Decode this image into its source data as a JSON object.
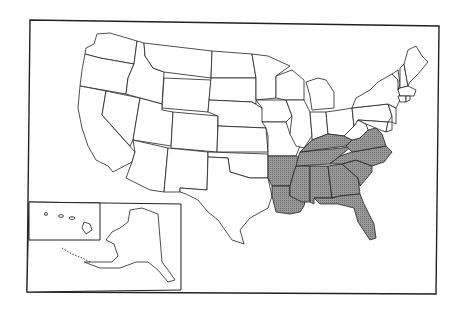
{
  "map": {
    "title": "United States",
    "width": 462,
    "height": 314,
    "colors": {
      "background": "#ffffff",
      "shaded_fill": "#8c8c8c",
      "unshaded_fill": "#ffffff",
      "border": "#222222"
    },
    "legend": null,
    "shaded_states": [
      "Arkansas",
      "Louisiana",
      "Mississippi",
      "Alabama",
      "Tennessee",
      "Kentucky",
      "Georgia",
      "Florida",
      "South Carolina",
      "North Carolina",
      "Virginia"
    ],
    "insets": [
      "Hawaii",
      "Alaska"
    ],
    "states": [
      {
        "name": "Washington",
        "shaded": false
      },
      {
        "name": "Oregon",
        "shaded": false
      },
      {
        "name": "California",
        "shaded": false
      },
      {
        "name": "Idaho",
        "shaded": false
      },
      {
        "name": "Nevada",
        "shaded": false
      },
      {
        "name": "Montana",
        "shaded": false
      },
      {
        "name": "Wyoming",
        "shaded": false
      },
      {
        "name": "Utah",
        "shaded": false
      },
      {
        "name": "Arizona",
        "shaded": false
      },
      {
        "name": "Colorado",
        "shaded": false
      },
      {
        "name": "New Mexico",
        "shaded": false
      },
      {
        "name": "North Dakota",
        "shaded": false
      },
      {
        "name": "South Dakota",
        "shaded": false
      },
      {
        "name": "Nebraska",
        "shaded": false
      },
      {
        "name": "Kansas",
        "shaded": false
      },
      {
        "name": "Oklahoma",
        "shaded": false
      },
      {
        "name": "Texas",
        "shaded": false
      },
      {
        "name": "Minnesota",
        "shaded": false
      },
      {
        "name": "Iowa",
        "shaded": false
      },
      {
        "name": "Missouri",
        "shaded": false
      },
      {
        "name": "Arkansas",
        "shaded": true
      },
      {
        "name": "Louisiana",
        "shaded": true
      },
      {
        "name": "Wisconsin",
        "shaded": false
      },
      {
        "name": "Illinois",
        "shaded": false
      },
      {
        "name": "Michigan",
        "shaded": false
      },
      {
        "name": "Indiana",
        "shaded": false
      },
      {
        "name": "Ohio",
        "shaded": false
      },
      {
        "name": "Kentucky",
        "shaded": true
      },
      {
        "name": "Tennessee",
        "shaded": true
      },
      {
        "name": "Mississippi",
        "shaded": true
      },
      {
        "name": "Alabama",
        "shaded": true
      },
      {
        "name": "Georgia",
        "shaded": true
      },
      {
        "name": "Florida",
        "shaded": true
      },
      {
        "name": "South Carolina",
        "shaded": true
      },
      {
        "name": "North Carolina",
        "shaded": true
      },
      {
        "name": "Virginia",
        "shaded": true
      },
      {
        "name": "West Virginia",
        "shaded": false
      },
      {
        "name": "Pennsylvania",
        "shaded": false
      },
      {
        "name": "New York",
        "shaded": false
      },
      {
        "name": "Maryland",
        "shaded": false
      },
      {
        "name": "Delaware",
        "shaded": false
      },
      {
        "name": "New Jersey",
        "shaded": false
      },
      {
        "name": "Connecticut",
        "shaded": false
      },
      {
        "name": "Rhode Island",
        "shaded": false
      },
      {
        "name": "Massachusetts",
        "shaded": false
      },
      {
        "name": "Vermont",
        "shaded": false
      },
      {
        "name": "New Hampshire",
        "shaded": false
      },
      {
        "name": "Maine",
        "shaded": false
      },
      {
        "name": "Alaska",
        "shaded": false
      },
      {
        "name": "Hawaii",
        "shaded": false
      }
    ]
  }
}
